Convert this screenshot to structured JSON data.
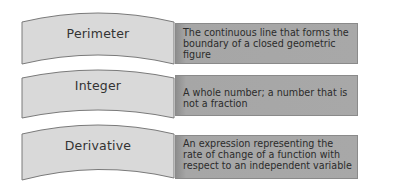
{
  "diagram": {
    "type": "term-definition matching",
    "rows": [
      {
        "term": "Perimeter",
        "definition": "The continuous line that forms the boundary of a closed geometric figure"
      },
      {
        "term": "Integer",
        "definition": "A whole number; a number that is not a fraction"
      },
      {
        "term": "Derivative",
        "definition": "An expression representing the rate of change of a function with respect to an independent variable"
      }
    ]
  },
  "colors": {
    "term_fill": "#d9d9d9",
    "term_stroke": "#7a7a7a",
    "definition_fill": "#a6a6a6",
    "text": "#333333"
  }
}
